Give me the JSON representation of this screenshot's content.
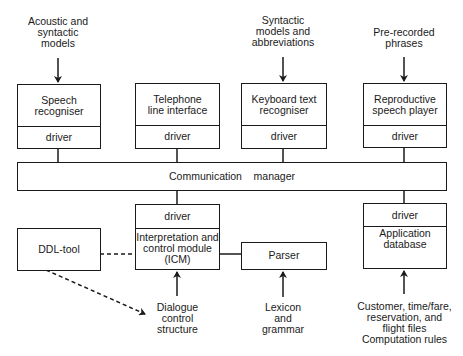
{
  "diagram": {
    "inputs_top": {
      "speech": "Acoustic and\nsyntactic\nmodels",
      "keyboard": "Syntactic\nmodels and\nabbreviations",
      "player": "Pre-recorded\nphrases"
    },
    "modules_top": [
      {
        "name": "Speech\nrecogniser",
        "driver": "driver"
      },
      {
        "name": "Telephone\nline interface",
        "driver": "driver"
      },
      {
        "name": "Keyboard text\nrecogniser",
        "driver": "driver"
      },
      {
        "name": "Reproductive\nspeech player",
        "driver": "driver"
      }
    ],
    "communication_manager": "Communication    manager",
    "icm": {
      "driver": "driver",
      "name": "Interpretation and\ncontrol module\n(ICM)"
    },
    "app_db": {
      "driver": "driver",
      "name": "Application\ndatabase"
    },
    "ddl_tool": "DDL-tool",
    "parser": "Parser",
    "inputs_bottom": {
      "dialogue": "Dialogue\ncontrol\nstructure",
      "lexicon": "Lexicon\nand\ngrammar",
      "files": "Customer,  time/fare,\nreservation, and\nflight files\nComputation rules"
    },
    "colors": {
      "line": "#1a1a1a",
      "background": "#ffffff"
    }
  }
}
